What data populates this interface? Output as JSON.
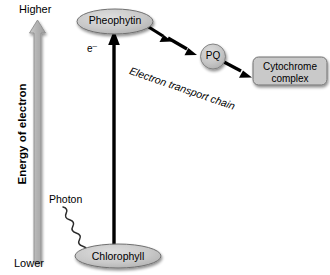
{
  "diagram": {
    "axis": {
      "title": "Energy of electron",
      "high_label": "Higher",
      "low_label": "Lower",
      "arrow_direction": "up"
    },
    "nodes": [
      {
        "id": "pheophytin",
        "label": "Pheophytin",
        "shape": "ellipse"
      },
      {
        "id": "pq",
        "label": "PQ",
        "shape": "circle"
      },
      {
        "id": "cytochrome",
        "label": "Cytochrome complex",
        "line1": "Cytochrome",
        "line2": "complex",
        "shape": "rounded-rect"
      },
      {
        "id": "chlorophyll",
        "label": "Chlorophyll",
        "shape": "ellipse"
      }
    ],
    "annotations": [
      {
        "id": "electron",
        "label": "e",
        "charge": "–"
      },
      {
        "id": "photon",
        "label": "Photon"
      },
      {
        "id": "etc",
        "label": "Electron transport chain"
      }
    ],
    "colors": {
      "node_fill": "#c9c9c9",
      "node_stroke": "#6e6e6e",
      "axis_arrow_fill": "#b3b3b3",
      "axis_arrow_stroke": "#8f8f8f",
      "flow_arrow": "#000000",
      "background": "#ffffff",
      "text": "#000000"
    }
  }
}
